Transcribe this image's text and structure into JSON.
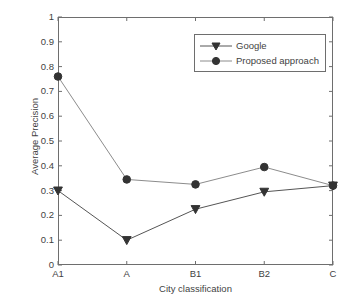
{
  "chart_data": {
    "type": "line",
    "title": "",
    "xlabel": "City classification",
    "ylabel": "Average Precision",
    "categories": [
      "A1",
      "A",
      "B1",
      "B2",
      "C"
    ],
    "xtick_labels": [
      "A1",
      "A",
      "B1",
      "B2",
      "C"
    ],
    "ytick_labels": [
      "0",
      "0.1",
      "0.2",
      "0.3",
      "0.4",
      "0.5",
      "0.6",
      "0.7",
      "0.8",
      "0.9",
      "1"
    ],
    "ytick_values": [
      0,
      0.1,
      0.2,
      0.3,
      0.4,
      0.5,
      0.6,
      0.7,
      0.8,
      0.9,
      1
    ],
    "ylim": [
      0,
      1
    ],
    "grid": false,
    "legend_position": "upper right",
    "series": [
      {
        "name": "Google",
        "marker": "triangle-down",
        "color": "#555555",
        "values": [
          0.3,
          0.1,
          0.225,
          0.295,
          0.32
        ]
      },
      {
        "name": "Proposed approach",
        "marker": "circle",
        "color": "#8c8c8c",
        "values": [
          0.76,
          0.345,
          0.325,
          0.395,
          0.32
        ]
      }
    ]
  },
  "legend": {
    "items": [
      {
        "label": "Google",
        "marker": "triangle-down-marker",
        "line_color": "#555555"
      },
      {
        "label": "Proposed approach",
        "marker": "circle-marker",
        "line_color": "#8c8c8c"
      }
    ]
  },
  "axes": {
    "x_title": "City classification",
    "y_title": "Average Precision"
  },
  "colors": {
    "axis": "#6e6e6e",
    "text": "#3f3f3f",
    "series_google": "#555555",
    "series_proposed": "#8c8c8c",
    "marker_fill": "#333333",
    "background": "#ffffff"
  }
}
